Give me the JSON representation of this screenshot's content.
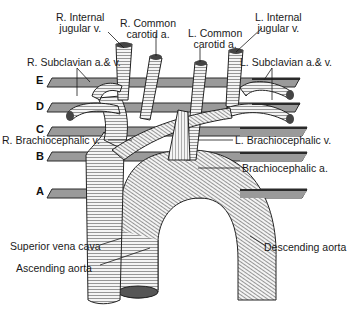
{
  "figure": {
    "type": "anatomical-illustration",
    "colors": {
      "ink": "#1a1a1a",
      "plane_fill": "#9a9a9a",
      "plane_edge": "#2a2a2a",
      "vessel_fill": "#f2f2f2"
    }
  },
  "planes": [
    {
      "id": "E",
      "label": "E"
    },
    {
      "id": "D",
      "label": "D"
    },
    {
      "id": "C",
      "label": "C"
    },
    {
      "id": "B",
      "label": "B"
    },
    {
      "id": "A",
      "label": "A"
    }
  ],
  "labels": {
    "r_internal_jugular": {
      "line1": "R. Internal",
      "line2": "jugular v."
    },
    "r_common_carotid": {
      "line1": "R. Common",
      "line2": "carotid a."
    },
    "l_common_carotid": {
      "line1": "L. Common",
      "line2": "carotid a."
    },
    "l_internal_jugular": {
      "line1": "L. Internal",
      "line2": "jugular v."
    },
    "r_subclavian": "R. Subclavian a.& v.",
    "l_subclavian": "L. Subclavian a.& v.",
    "r_brachiocephalic_v": "R. Brachiocephalic v.",
    "l_brachiocephalic_v": "L. Brachiocephalic v.",
    "brachiocephalic_a": "Brachiocephalic a.",
    "superior_vena_cava": "Superior vena cava",
    "ascending_aorta": "Ascending aorta",
    "descending_aorta": "Descending aorta"
  }
}
